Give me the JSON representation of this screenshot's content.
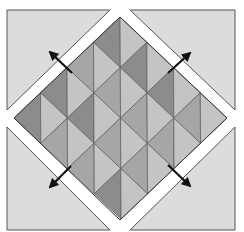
{
  "colors": {
    "background": "#ffffff",
    "corner": "#dcdcdc",
    "outline": "#555555",
    "dark": "#8c8c8c",
    "medium": "#a6a6a6",
    "light": "#c4c4c4",
    "arrow": "#111111"
  },
  "grid": {
    "rows": 4,
    "cols": 4,
    "cells": [
      [
        [
          "dark",
          "light"
        ],
        [
          "dark",
          "light"
        ],
        [
          "dark",
          "light"
        ],
        [
          "medium",
          "light"
        ]
      ],
      [
        [
          "medium",
          "light"
        ],
        [
          "medium",
          "light"
        ],
        [
          "medium",
          "light"
        ],
        [
          "medium",
          "light"
        ]
      ],
      [
        [
          "dark",
          "light"
        ],
        [
          "dark",
          "light"
        ],
        [
          "medium",
          "light"
        ],
        [
          "medium",
          "light"
        ]
      ],
      [
        [
          "dark",
          "light"
        ],
        [
          "medium",
          "light"
        ],
        [
          "medium",
          "light"
        ],
        [
          "dark",
          "light"
        ]
      ]
    ]
  },
  "corners": [
    "top-left",
    "top-right",
    "bottom-left",
    "bottom-right"
  ],
  "arrows": [
    {
      "name": "arrow-top-left",
      "direction": "up-left"
    },
    {
      "name": "arrow-top-right",
      "direction": "up-right"
    },
    {
      "name": "arrow-bottom-left",
      "direction": "down-left"
    },
    {
      "name": "arrow-bottom-right",
      "direction": "down-right"
    }
  ]
}
